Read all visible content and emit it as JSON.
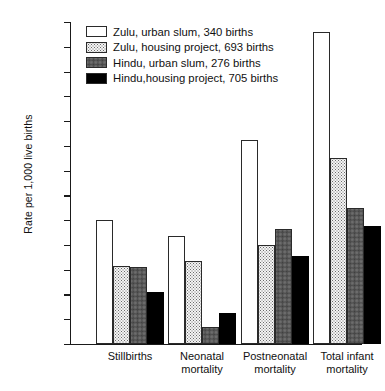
{
  "chart_data": {
    "type": "bar",
    "title": "",
    "xlabel": "",
    "ylabel": "Rate per 1,000 live births",
    "ylim": [
      0,
      130
    ],
    "ytick_step": 10,
    "yticks": [
      0,
      10,
      20,
      30,
      40,
      50,
      60,
      70,
      80,
      90,
      100,
      110,
      120,
      130
    ],
    "grid": false,
    "legend_position": "top-left-inside",
    "categories": [
      "Stillbirths",
      "Neonatal\nmortality",
      "Postneonatal\nmortality",
      "Total infant\nmortality"
    ],
    "series": [
      {
        "name": "Zulu, urban slum, 340 births",
        "group": "Zulu",
        "setting": "urban slum",
        "births": 340,
        "fill": "white",
        "color": "#ffffff",
        "values": [
          50,
          43.5,
          82.5,
          126
        ]
      },
      {
        "name": "Zulu, housing project, 693 births",
        "group": "Zulu",
        "setting": "housing project",
        "births": 693,
        "fill": "light-dots",
        "color": "#f4f4f4",
        "values": [
          31.5,
          33.5,
          40,
          75
        ]
      },
      {
        "name": "Hindu, urban slum, 276 births",
        "group": "Hindu",
        "setting": "urban slum",
        "births": 276,
        "fill": "gray-hatch",
        "color": "#a8a8a8",
        "values": [
          31,
          7,
          46.5,
          55
        ]
      },
      {
        "name": "Hindu, housing project, 705 births",
        "group": "Hindu",
        "setting": "housing project",
        "births": 705,
        "fill": "black",
        "color": "#000000",
        "values": [
          21,
          12.5,
          35.5,
          47.5
        ]
      }
    ]
  },
  "legend": {
    "items": [
      {
        "label": "Zulu, urban slum, 340 births",
        "swatch": "white"
      },
      {
        "label": "Zulu, housing project, 693 births",
        "swatch": "light-dots"
      },
      {
        "label": "Hindu, urban slum, 276 births",
        "swatch": "gray-hatch"
      },
      {
        "label": "Hindu,housing project, 705 births",
        "swatch": "black"
      }
    ]
  }
}
